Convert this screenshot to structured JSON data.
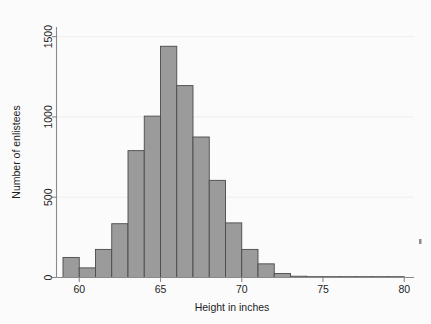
{
  "chart_data": {
    "type": "bar",
    "title": "",
    "subtitle": "",
    "xlabel": "Height in inches",
    "ylabel": "Number of enlistees",
    "xlim": [
      58.6,
      80.6
    ],
    "ylim": [
      0,
      1560
    ],
    "xticks": [
      60,
      65,
      70,
      75,
      80
    ],
    "xticklabels": [
      "60",
      "65",
      "70",
      "75",
      "80"
    ],
    "yticks": [
      0,
      500,
      1000,
      1500
    ],
    "yticklabels": [
      "0",
      "500",
      "1000",
      "1500"
    ],
    "grid": "horizontal",
    "legend": "none",
    "bin_width": 1,
    "bar_color": "#9b9b9b",
    "bar_edge_color": "#4a4a4a",
    "categories": [
      "59-60",
      "60-61",
      "61-62",
      "62-63",
      "63-64",
      "64-65",
      "65-66",
      "66-67",
      "67-68",
      "68-69",
      "69-70",
      "70-71",
      "71-72",
      "72-73",
      "73-74",
      "74-75",
      "75-76",
      "76-77",
      "77-78",
      "78-79",
      "79-80"
    ],
    "bin_starts": [
      59,
      60,
      61,
      62,
      63,
      64,
      65,
      66,
      67,
      68,
      69,
      70,
      71,
      72,
      73,
      74,
      75,
      76,
      77,
      78,
      79
    ],
    "values": [
      125,
      60,
      175,
      335,
      790,
      1005,
      1440,
      1195,
      875,
      605,
      340,
      175,
      85,
      25,
      8,
      4,
      2,
      1,
      1,
      1,
      1
    ],
    "annotations": []
  },
  "axes": {
    "x_title": "Height in inches",
    "y_title": "Number of enlistees"
  },
  "ticks": {
    "x": [
      "60",
      "65",
      "70",
      "75",
      "80"
    ],
    "y": [
      "0",
      "500",
      "1000",
      "1500"
    ]
  },
  "colors": {
    "bar_fill": "#9b9b9b",
    "bar_edge": "#4a4a4a",
    "axis": "#8a8a8a",
    "grid": "#f0eeee",
    "text": "#1d1d1d",
    "background": "#fbfbfb"
  }
}
